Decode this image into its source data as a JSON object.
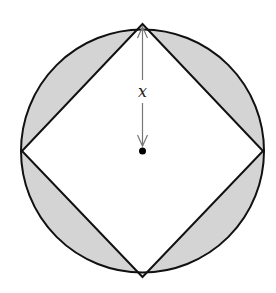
{
  "diagram": {
    "title": "",
    "labels": {
      "radius_label": "x"
    },
    "geometry": {
      "center": [
        142.5,
        151
      ],
      "radius": 121.5,
      "square_vertices": [
        [
          142.5,
          24
        ],
        [
          263,
          151
        ],
        [
          142.5,
          277
        ],
        [
          22,
          151
        ]
      ]
    },
    "colors": {
      "shading": "#d4d4d4",
      "outline": "#111111",
      "arrow": "#777777",
      "dot": "#000000",
      "background": "#ffffff"
    },
    "shaded_regions": [
      "top-left segment",
      "top-right segment",
      "bottom-left segment",
      "bottom-right segment"
    ]
  }
}
